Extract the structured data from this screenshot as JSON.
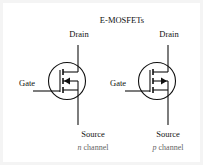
{
  "title": "E-MOSFETs",
  "symbols": [
    {
      "type": "n-channel",
      "drain_label": "Drain",
      "gate_label": "Gate",
      "source_label": "Source",
      "channel_prefix": "n",
      "channel_suffix": " channel",
      "arrow_direction": "inward"
    },
    {
      "type": "p-channel",
      "drain_label": "Drain",
      "gate_label": "Gate",
      "source_label": "Source",
      "channel_prefix": "p",
      "channel_suffix": " channel",
      "arrow_direction": "outward"
    }
  ],
  "colors": {
    "line": "#111111",
    "caption": "#666666",
    "background": "#ffffff",
    "border": "#f4f4f4"
  }
}
